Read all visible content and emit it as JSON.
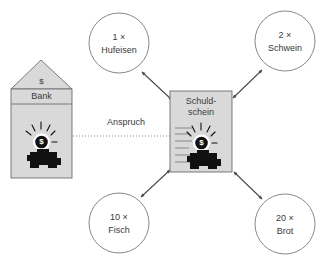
{
  "diagram": {
    "title_note": "Anspruch",
    "bank": {
      "roof_symbol": "$",
      "label": "Bank",
      "coin_glyph": "$"
    },
    "note": {
      "line1": "Schuld-",
      "line2": "schein",
      "coin_glyph": "$"
    },
    "link_label": "Anspruch",
    "goods": [
      {
        "id": "hufeisen",
        "qty": "1 ×",
        "name": "Hufeisen"
      },
      {
        "id": "schwein",
        "qty": "2 ×",
        "name": "Schwein"
      },
      {
        "id": "fisch",
        "qty": "10 ×",
        "name": "Fisch"
      },
      {
        "id": "brot",
        "qty": "20 ×",
        "name": "Brot"
      }
    ],
    "colors": {
      "shape_fill": "#d9d9d9",
      "shape_stroke": "#6e6e6e",
      "circle_stroke": "#7b7b7b",
      "text": "#3a3a3a",
      "arrow": "#4a4a4a",
      "dotted": "#8a8a8a",
      "background": "#ffffff"
    }
  }
}
